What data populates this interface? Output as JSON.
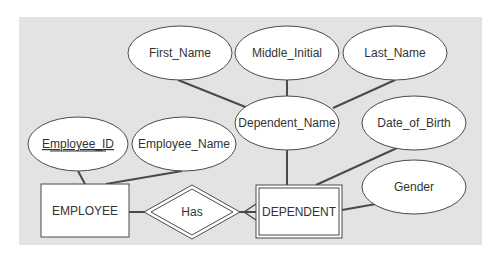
{
  "diagram": {
    "type": "entity-relationship",
    "colors": {
      "panel": "#e3e3e3",
      "shape_fill": "#ffffff",
      "stroke": "#4a4a4a",
      "text": "#333333"
    },
    "entities": [
      {
        "id": "employee",
        "label": "EMPLOYEE",
        "weak": false
      },
      {
        "id": "dependent",
        "label": "DEPENDENT",
        "weak": true
      }
    ],
    "relationships": [
      {
        "id": "has",
        "label": "Has",
        "identifying": true,
        "from": "employee",
        "to": "dependent",
        "cardinality_to": "many"
      }
    ],
    "attributes": [
      {
        "id": "employee_id",
        "label": "Employee_ID",
        "entity": "employee",
        "key": true
      },
      {
        "id": "employee_name",
        "label": "Employee_Name",
        "entity": "employee",
        "key": false
      },
      {
        "id": "dependent_name",
        "label": "Dependent_Name",
        "entity": "dependent",
        "composite": true
      },
      {
        "id": "first_name",
        "label": "First_Name",
        "parent": "dependent_name"
      },
      {
        "id": "middle_initial",
        "label": "Middle_Initial",
        "parent": "dependent_name"
      },
      {
        "id": "last_name",
        "label": "Last_Name",
        "parent": "dependent_name"
      },
      {
        "id": "date_of_birth",
        "label": "Date_of_Birth",
        "entity": "dependent"
      },
      {
        "id": "gender",
        "label": "Gender",
        "entity": "dependent"
      }
    ]
  },
  "labels": {
    "first_name": "First_Name",
    "middle_initial": "Middle_Initial",
    "last_name": "Last_Name",
    "dependent_name": "Dependent_Name",
    "date_of_birth": "Date_of_Birth",
    "employee_id": "Employee_ID",
    "employee_name": "Employee_Name",
    "gender": "Gender",
    "employee": "EMPLOYEE",
    "has": "Has",
    "dependent": "DEPENDENT"
  }
}
